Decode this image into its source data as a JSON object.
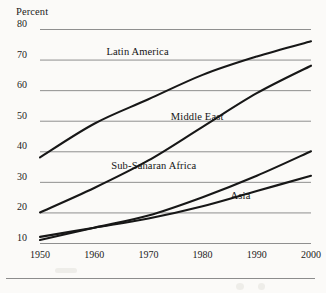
{
  "figure": {
    "background_color": "#fbfaf8",
    "ink_color": "#171717",
    "grid_color": "#8f8f8f"
  },
  "axis": {
    "y_title": "Percent",
    "y_ticks": [
      "80",
      "70",
      "60",
      "50",
      "40",
      "30",
      "20",
      "10"
    ],
    "x_ticks": [
      "1950",
      "1960",
      "1970",
      "1980",
      "1990",
      "2000"
    ]
  },
  "series_labels": {
    "latin_america": "Latin America",
    "middle_east": "Middle East",
    "sub_saharan_africa": "Sub-Saharan Africa",
    "asia": "Asia"
  },
  "caption": {
    "partial_text": ""
  },
  "chart_data": {
    "type": "line",
    "title": "",
    "xlabel": "",
    "ylabel": "Percent",
    "xlim": [
      1950,
      2000
    ],
    "ylim": [
      8,
      80
    ],
    "grid": true,
    "legend": "inline-labels",
    "x": [
      1950,
      1960,
      1970,
      1980,
      1990,
      2000
    ],
    "series": [
      {
        "name": "Latin America",
        "values": [
          38,
          49,
          57,
          65,
          71,
          76
        ],
        "label_position": {
          "x": 1968,
          "y": 72
        }
      },
      {
        "name": "Middle East",
        "values": [
          20,
          28,
          37,
          48,
          59,
          68
        ],
        "label_position": {
          "x": 1979,
          "y": 51
        }
      },
      {
        "name": "Sub-Saharan Africa",
        "values": [
          11,
          15,
          19,
          25,
          32,
          40
        ],
        "label_position": {
          "x": 1971,
          "y": 35
        }
      },
      {
        "name": "Asia",
        "values": [
          12,
          15,
          18,
          22,
          27,
          32
        ],
        "label_position": {
          "x": 1987,
          "y": 25
        }
      }
    ]
  }
}
